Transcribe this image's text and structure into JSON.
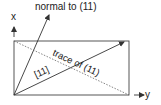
{
  "diagram": {
    "title_label": "normal to (11)",
    "trace_label": "trace of (11)",
    "direction_label": "[11]",
    "axis_x_label": "x",
    "axis_y_label": "y",
    "colors": {
      "line": "#333333",
      "dashed": "#555555",
      "background": "#ffffff"
    }
  }
}
